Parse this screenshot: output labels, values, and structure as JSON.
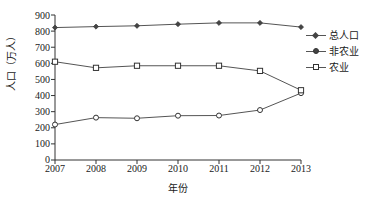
{
  "chart_data": {
    "type": "line",
    "title": "",
    "xlabel": "年份",
    "ylabel": "人口（万人）",
    "categories": [
      "2007",
      "2008",
      "2009",
      "2010",
      "2011",
      "2012",
      "2013"
    ],
    "x": [
      2007,
      2008,
      2009,
      2010,
      2011,
      2012,
      2013
    ],
    "ylim": [
      0,
      900
    ],
    "y_ticks": [
      "0",
      "100",
      "200",
      "300",
      "400",
      "500",
      "600",
      "700",
      "800",
      "900"
    ],
    "y_tick_values": [
      0,
      100,
      200,
      300,
      400,
      500,
      600,
      700,
      800,
      900
    ],
    "grid": false,
    "legend_position": "right",
    "series": [
      {
        "name": "总人口",
        "marker": "diamond",
        "values": [
          822,
          828,
          833,
          843,
          851,
          851,
          825
        ]
      },
      {
        "name": "非农业",
        "marker": "circle",
        "values": [
          220,
          263,
          259,
          275,
          276,
          310,
          415
        ]
      },
      {
        "name": "农业",
        "marker": "square",
        "values": [
          610,
          572,
          585,
          585,
          585,
          553,
          433
        ]
      }
    ]
  },
  "legend": {
    "items": [
      {
        "label": "总人口",
        "marker": "diamond-marker"
      },
      {
        "label": "非农业",
        "marker": "circle-marker"
      },
      {
        "label": "农业",
        "marker": "square-marker"
      }
    ]
  },
  "axes": {
    "y_title": "人口（万人）",
    "x_title": "年份"
  },
  "colors": {
    "line": "#555555",
    "marker_fill_dark": "#444444",
    "marker_fill_light": "#ffffff",
    "marker_stroke": "#333333",
    "axis": "#333333",
    "text": "#1a1a1a",
    "background": "#ffffff"
  }
}
